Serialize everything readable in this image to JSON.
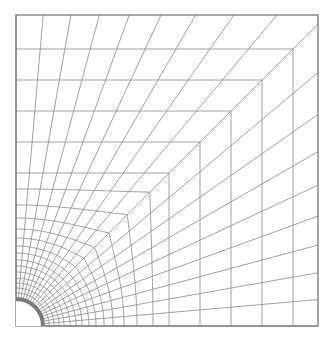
{
  "figure": {
    "type": "structured-mesh",
    "canvas": {
      "width": 335,
      "height": 344
    },
    "domain": {
      "left": 16,
      "top": 15,
      "right": 318,
      "bottom": 326
    },
    "hole": {
      "center": [
        16,
        326
      ],
      "radius": 29,
      "ring_width": 4,
      "color": "#7a7a7a"
    },
    "mesh": {
      "spoke_count": 19,
      "ring_distances": [
        33,
        38,
        43,
        48,
        54,
        60,
        66,
        73,
        80,
        88,
        97,
        108,
        121,
        137,
        153,
        184,
        215,
        246,
        277
      ],
      "square_blend_start": 60,
      "square_blend_full": 153,
      "line_color": "#8a8a8a",
      "line_width": 0.8,
      "border_color": "#6e6e6e",
      "border_width": 1.2
    }
  }
}
